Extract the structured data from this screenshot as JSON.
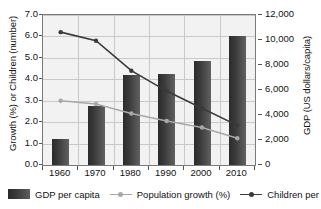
{
  "chart_data": {
    "type": "bar",
    "title": "",
    "subtitle": "",
    "categories": [
      "1960",
      "1970",
      "1980",
      "1990",
      "2000",
      "2010"
    ],
    "xlabel": "",
    "ylabel": "Growth (%) or Children (number)",
    "y2label": "GDP (US dollars/capita)",
    "ylim": [
      0,
      7
    ],
    "y2lim": [
      0,
      12000
    ],
    "ytick_labels": [
      "0.0",
      "1.0",
      "2.0",
      "3.0",
      "4.0",
      "5.0",
      "6.0",
      "7.0"
    ],
    "ytick_values": [
      0,
      1,
      2,
      3,
      4,
      5,
      6,
      7
    ],
    "y2tick_labels": [
      "0",
      "2,000",
      "4,000",
      "6,000",
      "8,000",
      "10,000",
      "12,000"
    ],
    "y2tick_values": [
      0,
      2000,
      4000,
      6000,
      8000,
      10000,
      12000
    ],
    "grid": true,
    "legend_position": "bottom",
    "series": [
      {
        "name": "GDP per capita",
        "kind": "bar",
        "axis": "right",
        "unit": "US dollars/capita",
        "values": [
          2100,
          4700,
          7200,
          7250,
          8300,
          10350
        ],
        "color": "#3a3a3a"
      },
      {
        "name": "Population growth (%)",
        "kind": "line",
        "axis": "left",
        "unit": "%",
        "values": [
          3.0,
          2.85,
          2.4,
          2.05,
          1.75,
          1.25
        ],
        "color": "#a8a8a8"
      },
      {
        "name": "Children per",
        "kind": "line",
        "axis": "left",
        "unit": "number",
        "values": [
          6.2,
          5.8,
          4.4,
          3.45,
          2.65,
          1.85
        ],
        "color": "#3a3a3a"
      }
    ]
  },
  "legend": {
    "items": [
      {
        "label": "GDP per capita",
        "marker": "bar-swatch",
        "color": "#3a3a3a"
      },
      {
        "label": "Population growth (%)",
        "marker": "line-marker",
        "color": "#a8a8a8"
      },
      {
        "label": "Children per",
        "marker": "line-marker",
        "color": "#3a3a3a"
      }
    ]
  },
  "colors": {
    "plot_background": "#f2f2f2",
    "gridline": "#c9c9c9",
    "axis": "#7a7a7a",
    "bar_dark": "#2b2b2b",
    "bar_light": "#616161",
    "line_children": "#3a3a3a",
    "line_population": "#a8a8a8",
    "text": "#111111"
  }
}
